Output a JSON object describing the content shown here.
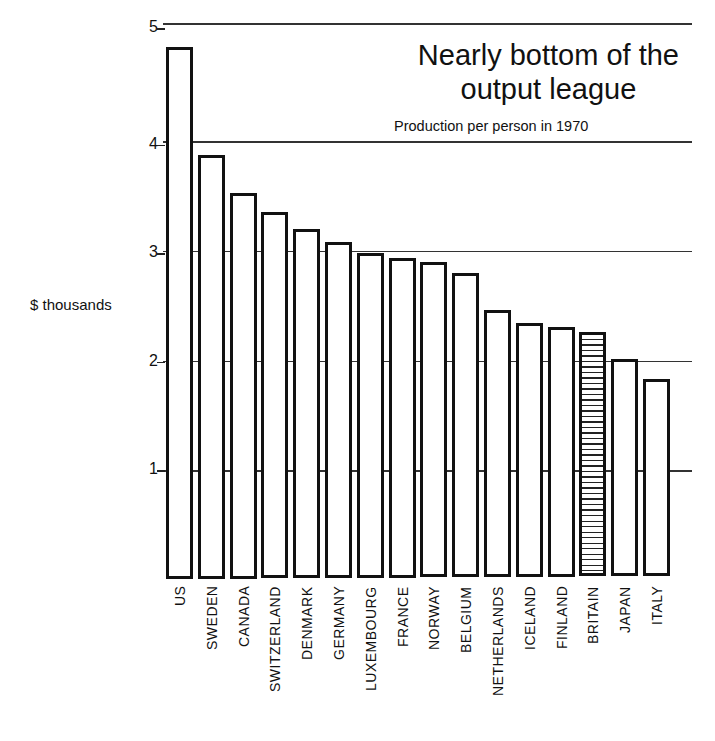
{
  "chart_data": {
    "type": "bar",
    "title": "Nearly bottom of the output league",
    "title_lines": [
      "Nearly bottom of the",
      "output league"
    ],
    "subtitle": "Production per person in 1970",
    "xlabel": "",
    "ylabel": "$ thousands",
    "ylim": [
      0,
      5
    ],
    "yticks": [
      1,
      2,
      3,
      4,
      5
    ],
    "grid": true,
    "legend": null,
    "categories": [
      "US",
      "SWEDEN",
      "CANADA",
      "SWITZERLAND",
      "DENMARK",
      "GERMANY",
      "LUXEMBOURG",
      "FRANCE",
      "NORWAY",
      "BELGIUM",
      "NETHERLANDS",
      "ICELAND",
      "FINLAND",
      "BRITAIN",
      "JAPAN",
      "ITALY"
    ],
    "values": [
      4.9,
      3.9,
      3.55,
      3.38,
      3.22,
      3.1,
      3.0,
      2.96,
      2.92,
      2.82,
      2.48,
      2.36,
      2.32,
      2.27,
      2.03,
      1.84
    ],
    "highlight": "BRITAIN",
    "highlight_style": "horizontal-hatch"
  },
  "colors": {
    "ink": "#111111",
    "background": "#ffffff"
  }
}
